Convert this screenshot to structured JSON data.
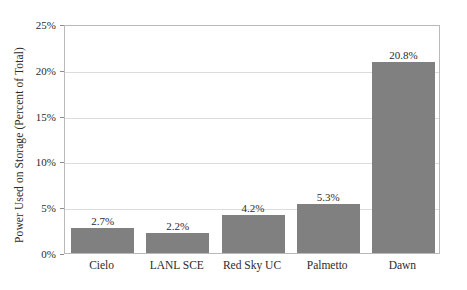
{
  "chart_data": {
    "type": "bar",
    "title": "",
    "subtitle": "",
    "xlabel": "",
    "ylabel": "Power Used on Storage (Percent of Total)",
    "categories": [
      "Cielo",
      "LANL SCE",
      "Red Sky UC",
      "Palmetto",
      "Dawn"
    ],
    "values": [
      2.7,
      2.2,
      4.2,
      5.3,
      20.8
    ],
    "value_labels": [
      "2.7%",
      "2.2%",
      "4.2%",
      "5.3%",
      "20.8%"
    ],
    "ylim": [
      0,
      25
    ],
    "yticks": [
      0,
      5,
      10,
      15,
      20,
      25
    ],
    "ytick_labels": [
      "0%",
      "5%",
      "10%",
      "15%",
      "20%",
      "25%"
    ],
    "grid": true,
    "grid_axis": "y",
    "legend": false,
    "legend_position": "none",
    "bar_color": "#808080",
    "grid_color": "#dcdcdc",
    "frame_color": "#b9b9b9",
    "background_color": "#ffffff",
    "text_color": "#2b2b2b"
  }
}
